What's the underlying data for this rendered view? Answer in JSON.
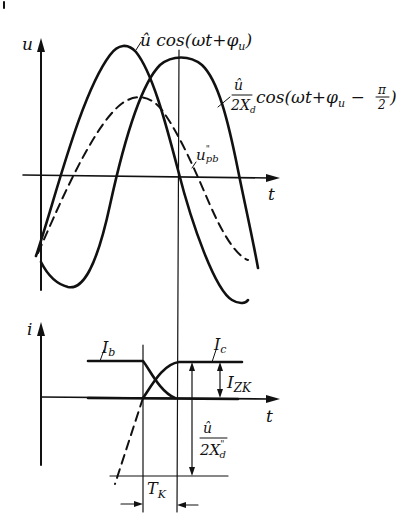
{
  "figure": {
    "type": "waveform-diagram",
    "upper_plot": {
      "y_axis_label": "u",
      "x_axis_label": "t",
      "curves": [
        {
          "name": "source-voltage",
          "label_main": "û cos(ωt+φ",
          "label_sub": "u",
          "label_end": ")",
          "style": "solid"
        },
        {
          "name": "reactance-voltage",
          "label_frac_num": "û",
          "label_frac_den": "2X",
          "label_frac_den_sub": "d",
          "label_frac_den_sup": "\"",
          "label_expr": "cos(ωt+φ",
          "label_expr_sub": "u",
          "label_expr_mid": " − ",
          "label_pi_num": "π",
          "label_pi_den": "2",
          "label_end": ")",
          "style": "solid"
        },
        {
          "name": "recovery-voltage",
          "label_main": "u",
          "label_sup": "\"",
          "label_sub": "pb",
          "style": "dashed"
        }
      ]
    },
    "lower_plot": {
      "y_axis_label": "i",
      "x_axis_label": "t",
      "labels": {
        "ib": {
          "main": "I",
          "sub": "b"
        },
        "ic": {
          "main": "I",
          "sub": "c"
        },
        "izk": {
          "main": "I",
          "sub": "ZK"
        },
        "frac_num": "û",
        "frac_den": "2X",
        "frac_den_sub": "d",
        "frac_den_sup": "\"",
        "tk": {
          "main": "T",
          "sub": "K"
        }
      }
    }
  }
}
